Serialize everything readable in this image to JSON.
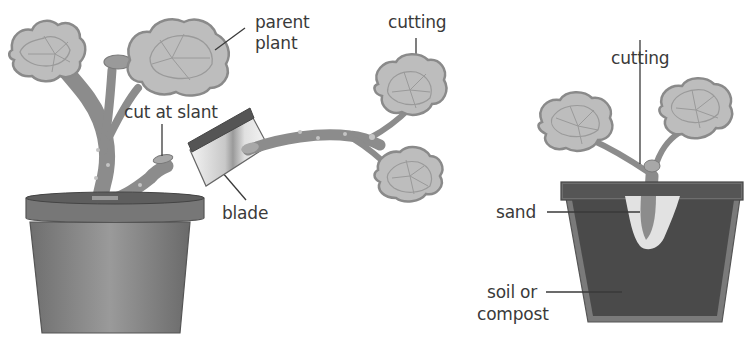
{
  "diagram": {
    "panels": [
      {
        "name": "taking-cutting",
        "labels": {
          "parent_plant_line1": "parent",
          "parent_plant_line2": "plant",
          "cut_at_slant": "cut at slant",
          "blade": "blade",
          "cutting": "cutting"
        }
      },
      {
        "name": "potted-cutting",
        "labels": {
          "cutting": "cutting",
          "sand": "sand",
          "soil_line1": "soil or",
          "soil_line2": "compost"
        }
      }
    ],
    "colors": {
      "leaf_fill": "#bdbdbd",
      "leaf_edge": "#8a8a8a",
      "stem": "#8c8c8c",
      "pot": "#7a7a7a",
      "pot_rim": "#6e6e6e",
      "soil": "#4a4a4a",
      "sand": "#e2e2e2",
      "blade_handle": "#555555",
      "text": "#3a3a3a"
    }
  }
}
